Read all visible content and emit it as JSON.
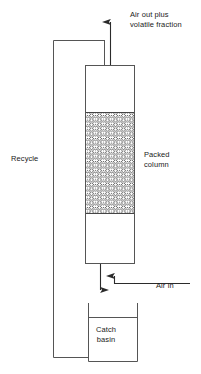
{
  "diagram": {
    "type": "process-flow-diagram",
    "stroke_color": "#333333",
    "text_color": "#1a1a1a",
    "background_color": "#ffffff",
    "packing_fill": "#d9d9d9"
  },
  "labels": {
    "air_out": "Air out plus\nvolatile fraction",
    "recycle": "Recycle",
    "packed_column": "Packed\ncolumn",
    "air_in": "Air in",
    "catch_basin": "Catch\nbasin"
  },
  "components": {
    "column": {
      "name": "Packed column",
      "x": 85,
      "y": 65,
      "width": 50,
      "height": 199
    },
    "packing": {
      "name": "Packing media",
      "x": 86,
      "y": 112,
      "width": 48,
      "height": 102
    },
    "catch_basin": {
      "name": "Catch basin",
      "x": 88,
      "y": 303,
      "width": 50,
      "height": 59
    },
    "recycle_pipe": {
      "name": "Recycle line",
      "x": 53,
      "y_top": 40,
      "y_bottom": 357
    }
  },
  "flows": [
    {
      "name": "air-out-plus-volatile-fraction",
      "direction": "up",
      "label": "Air out plus volatile fraction"
    },
    {
      "name": "recycle",
      "direction": "up",
      "label": "Recycle"
    },
    {
      "name": "air-in",
      "direction": "in",
      "label": "Air in"
    },
    {
      "name": "drain-to-catch-basin",
      "direction": "down",
      "label": ""
    }
  ]
}
